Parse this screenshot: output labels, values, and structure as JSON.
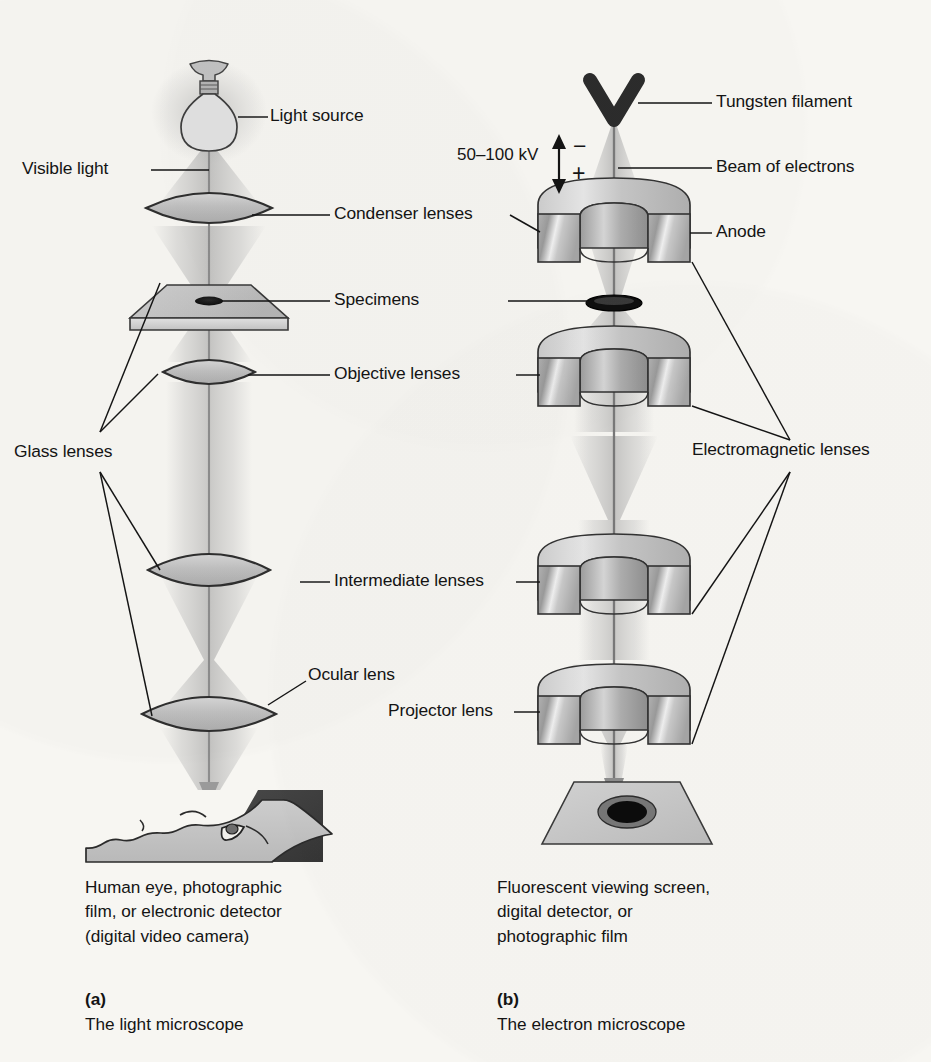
{
  "figure": {
    "background_color": "#f7f6f2",
    "ink_color": "#141414"
  },
  "light_microscope": {
    "panel_id": "a",
    "caption_label": "(a)",
    "caption_title": "The light microscope",
    "detector_caption": "Human eye, photographic\nfilm, or electronic detector\n(digital video camera)",
    "labels": {
      "light_source": "Light source",
      "visible_light": "Visible light",
      "glass_lenses": "Glass lenses",
      "ocular_lens": "Ocular lens"
    },
    "components": [
      {
        "name": "light-source-bulb",
        "label": "Light source"
      },
      {
        "name": "condenser-lens",
        "label": "Condenser lenses"
      },
      {
        "name": "specimen-slide",
        "label": "Specimens"
      },
      {
        "name": "objective-lens",
        "label": "Objective lenses"
      },
      {
        "name": "intermediate-lens",
        "label": "Intermediate lenses"
      },
      {
        "name": "ocular-lens",
        "label": "Ocular lens"
      },
      {
        "name": "human-eye-observer",
        "label": "Human eye"
      }
    ]
  },
  "electron_microscope": {
    "panel_id": "b",
    "caption_label": "(b)",
    "caption_title": "The electron microscope",
    "detector_caption": "Fluorescent viewing screen,\ndigital detector, or\nphotographic film",
    "labels": {
      "tungsten_filament": "Tungsten filament",
      "beam_of_electrons": "Beam of electrons",
      "anode": "Anode",
      "electromagnetic_lenses": "Electromagnetic lenses",
      "projector_lens": "Projector lens"
    },
    "voltage": {
      "value": "50–100 kV",
      "negative_symbol": "−",
      "positive_symbol": "+"
    },
    "components": [
      {
        "name": "tungsten-filament",
        "label": "Tungsten filament"
      },
      {
        "name": "anode-condenser-lens",
        "label": "Anode"
      },
      {
        "name": "specimen-disc",
        "label": "Specimens"
      },
      {
        "name": "objective-lens",
        "label": "Objective lenses"
      },
      {
        "name": "intermediate-lens",
        "label": "Intermediate lenses"
      },
      {
        "name": "projector-lens",
        "label": "Projector lens"
      },
      {
        "name": "viewing-screen",
        "label": "Fluorescent viewing screen"
      }
    ]
  },
  "shared_labels": {
    "condenser_lenses": "Condenser lenses",
    "specimens": "Specimens",
    "objective_lenses": "Objective lenses",
    "intermediate_lenses": "Intermediate lenses"
  }
}
